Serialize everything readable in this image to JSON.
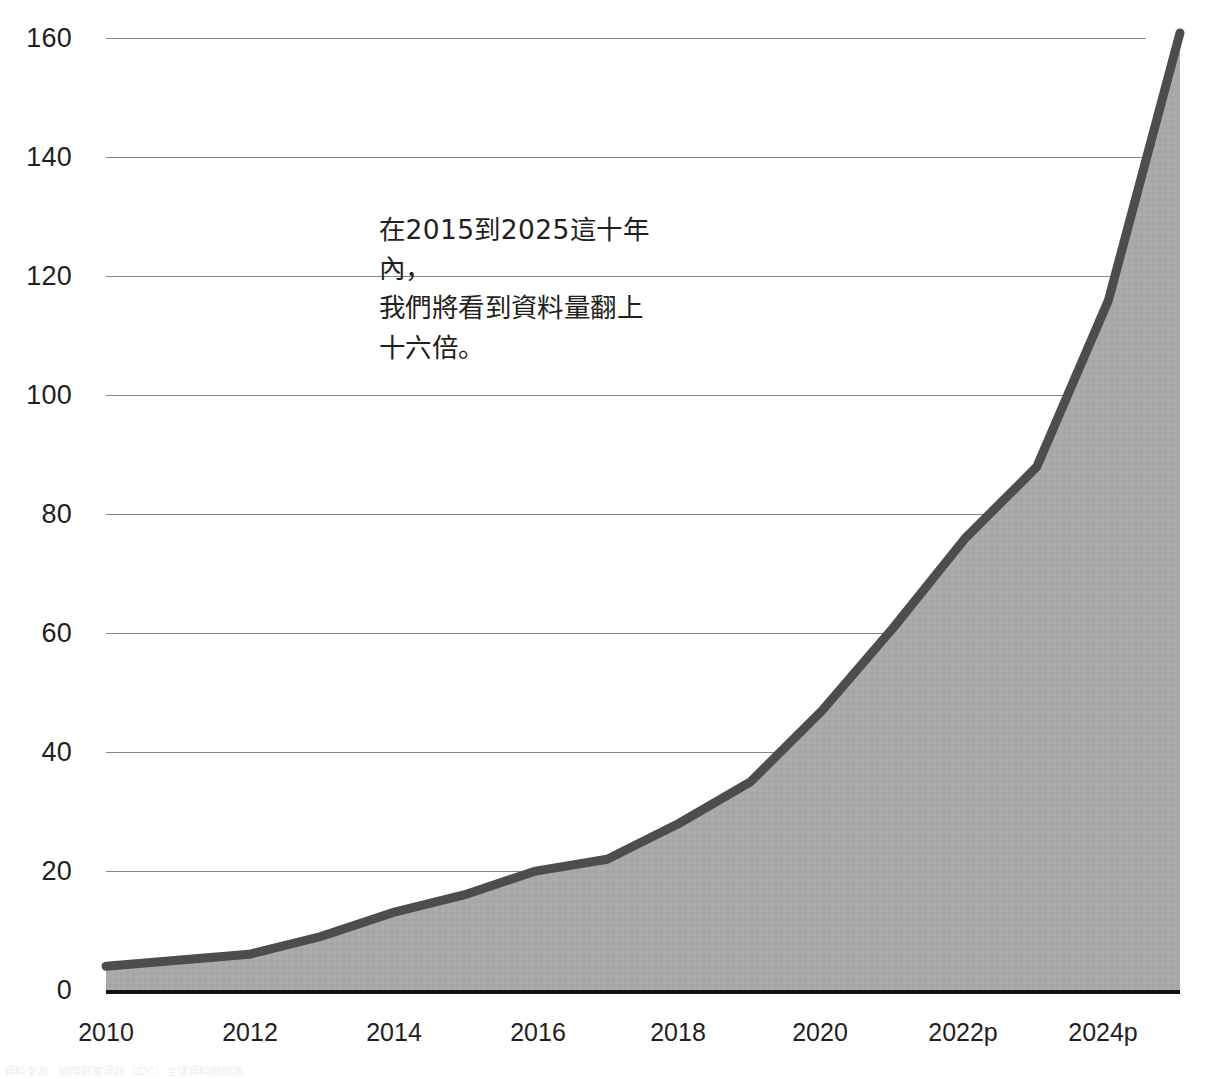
{
  "chart_data": {
    "type": "area",
    "title": "",
    "subtitle": "",
    "xlabel": "",
    "ylabel": "",
    "x": [
      2010,
      2011,
      2012,
      2013,
      2014,
      2015,
      2016,
      2017,
      2018,
      2019,
      2020,
      2021,
      2022,
      2023,
      2024,
      2025
    ],
    "categories": [
      "2010",
      "2011",
      "2012",
      "2013",
      "2014",
      "2015",
      "2016",
      "2017",
      "2018",
      "2019",
      "2020",
      "2021",
      "2022",
      "2023",
      "2024p",
      "2025p"
    ],
    "values": [
      4,
      5,
      6,
      9,
      13,
      16,
      20,
      22,
      28,
      35,
      47,
      61,
      76,
      88,
      116,
      161
    ],
    "series": [
      {
        "name": "Global data volume (zettabytes)",
        "values": [
          4,
          5,
          6,
          9,
          13,
          16,
          20,
          22,
          28,
          35,
          47,
          61,
          76,
          88,
          116,
          161
        ]
      }
    ],
    "xtick_labels": [
      "2010",
      "2012",
      "2014",
      "2016",
      "2018",
      "2020",
      "2022p",
      "2024p"
    ],
    "ytick_labels": [
      "0",
      "20",
      "40",
      "60",
      "80",
      "100",
      "120",
      "140",
      "160"
    ],
    "ytick_values": [
      0,
      20,
      40,
      60,
      80,
      100,
      120,
      140,
      160
    ],
    "ylim": [
      0,
      166
    ],
    "xlim": [
      2010,
      2025.1
    ],
    "grid": true,
    "legend": "none",
    "line_color": "#4d4d4d",
    "fill_color": "#a8a8a8",
    "baseline_color": "#15110f",
    "gridline_color": "#6f6f6f",
    "text_color": "#231f20",
    "annotations": [
      {
        "text": "在2015到2025這十年內，\n我們將看到資料量翻上\n十六倍。",
        "x": 2013.8,
        "y": 128
      }
    ]
  },
  "annotation": {
    "text": "在2015到2025這十年內，\n我們將看到資料量翻上\n十六倍。"
  },
  "footnote": {
    "text": "資料來源：國際數據資訊（IDC）全球資料圈預測"
  }
}
